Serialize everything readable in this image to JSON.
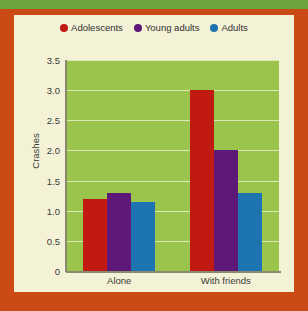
{
  "figure": {
    "frame_color": "#cc4a16",
    "band_color": "#6ca33c",
    "panel_color": "#f4f2d6"
  },
  "chart_data": {
    "type": "bar",
    "title": "",
    "xlabel": "",
    "ylabel": "Crashes",
    "categories": [
      "Alone",
      "With friends"
    ],
    "series": [
      {
        "name": "Adolescents",
        "color": "#c01a12",
        "values": [
          1.2,
          3.0
        ]
      },
      {
        "name": "Young adults",
        "color": "#5e1878",
        "values": [
          1.3,
          2.0
        ]
      },
      {
        "name": "Adults",
        "color": "#1e74b0",
        "values": [
          1.15,
          1.3
        ]
      }
    ],
    "ylim": [
      0,
      3.5
    ],
    "yticks": [
      "0",
      "0.5",
      "1.0",
      "1.5",
      "2.0",
      "2.5",
      "3.0",
      "3.5"
    ],
    "ytick_values": [
      0,
      0.5,
      1.0,
      1.5,
      2.0,
      2.5,
      3.0,
      3.5
    ],
    "grid": true,
    "gridlines_at": [
      0.5,
      1.0,
      1.5,
      2.0,
      2.5,
      3.0,
      3.5
    ],
    "legend_position": "top",
    "plot_background": "#9bc44c",
    "gridline_color": "#e6efc4"
  }
}
